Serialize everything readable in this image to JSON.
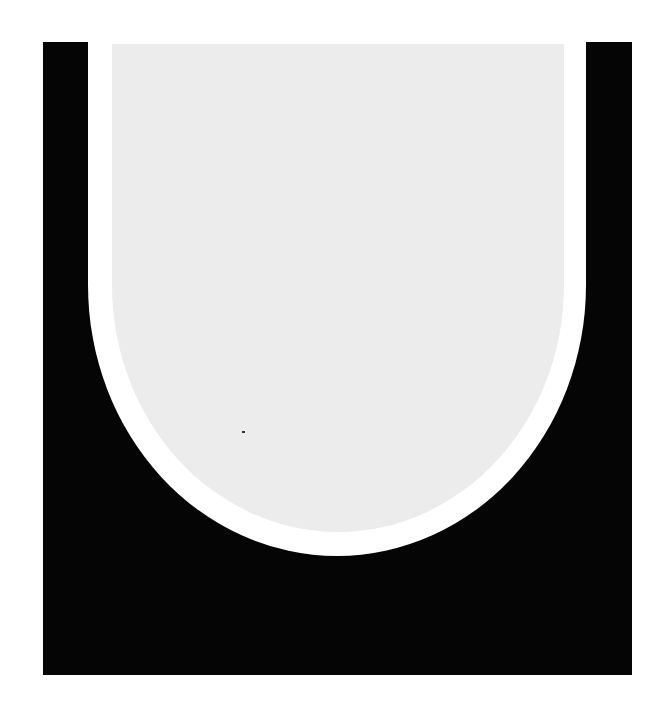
{
  "figure": {
    "colors": {
      "background": "#ffffff",
      "outer_block": "#050505",
      "band": "#ffffff",
      "inner_panel": "#ececec",
      "speck": "#333333"
    }
  }
}
